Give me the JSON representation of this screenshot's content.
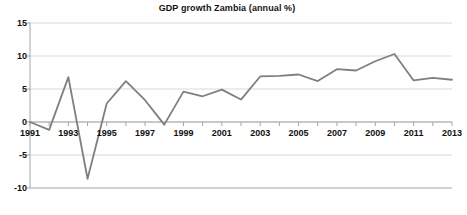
{
  "chart_data": {
    "type": "line",
    "title": "GDP growth Zambia (annual %)",
    "xlabel": "",
    "ylabel": "",
    "grid": true,
    "legend": "none",
    "line_color": "#7f7f7f",
    "gridline_color": "#d9d9d9",
    "axis_color": "#a6a6a6",
    "plot_background": "#ffffff",
    "ylim": [
      -10,
      15
    ],
    "ytick_labels": [
      "15",
      "10",
      "5",
      "0",
      "-5",
      "-10"
    ],
    "yticks": [
      15,
      10,
      5,
      0,
      -5,
      -10
    ],
    "xlim": [
      1991,
      2013
    ],
    "xtick_labels": [
      "1991",
      "1993",
      "1995",
      "1997",
      "1999",
      "2001",
      "2003",
      "2005",
      "2007",
      "2009",
      "2011",
      "2013"
    ],
    "x": [
      1991,
      1992,
      1993,
      1994,
      1995,
      1996,
      1997,
      1998,
      1999,
      2000,
      2001,
      2002,
      2003,
      2004,
      2005,
      2006,
      2007,
      2008,
      2009,
      2010,
      2011,
      2012,
      2013
    ],
    "values": [
      0.0,
      -1.2,
      6.8,
      -8.6,
      2.8,
      6.2,
      3.3,
      -0.4,
      4.6,
      3.9,
      4.9,
      3.4,
      6.9,
      7.0,
      7.2,
      6.2,
      8.0,
      7.8,
      9.2,
      10.3,
      6.3,
      6.7,
      6.4
    ],
    "series": [
      {
        "name": "GDP growth Zambia (annual %)",
        "values": [
          0.0,
          -1.2,
          6.8,
          -8.6,
          2.8,
          6.2,
          3.3,
          -0.4,
          4.6,
          3.9,
          4.9,
          3.4,
          6.9,
          7.0,
          7.2,
          6.2,
          8.0,
          7.8,
          9.2,
          10.3,
          6.3,
          6.7,
          6.4
        ]
      }
    ]
  }
}
